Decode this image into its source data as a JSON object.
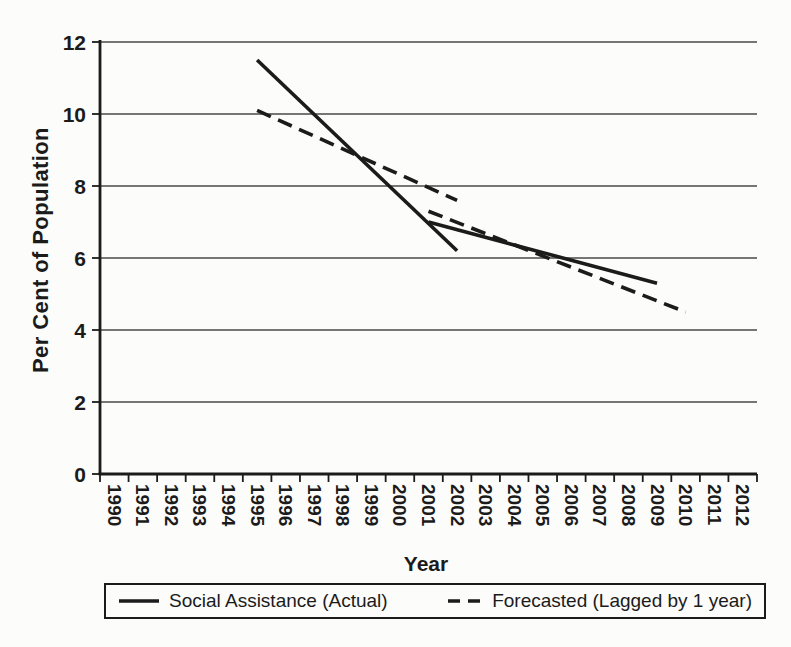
{
  "figure": {
    "background": "#fcfcfa",
    "line_color": "#1b1b1b"
  },
  "chart_data": {
    "type": "line",
    "title": "",
    "xlabel": "Year",
    "ylabel": "Per Cent of Population",
    "x_categories": [
      "1990",
      "1991",
      "1992",
      "1993",
      "1994",
      "1995",
      "1996",
      "1997",
      "1998",
      "1999",
      "2000",
      "2001",
      "2002",
      "2003",
      "2004",
      "2005",
      "2006",
      "2007",
      "2008",
      "2009",
      "2010",
      "2011",
      "2012"
    ],
    "y_ticks": [
      0,
      2,
      4,
      6,
      8,
      10,
      12
    ],
    "ylim": [
      0,
      12
    ],
    "grid": "horizontal",
    "legend_position": "bottom",
    "series": [
      {
        "name": "Social Assistance (Actual)",
        "style": "solid",
        "color": "#1b1b1b",
        "segments": [
          {
            "points": [
              [
                1995,
                11.5
              ],
              [
                2002,
                6.2
              ]
            ]
          },
          {
            "points": [
              [
                2001,
                7.0
              ],
              [
                2009,
                5.3
              ]
            ]
          }
        ]
      },
      {
        "name": "Forecasted (Lagged by 1 year)",
        "style": "dashed",
        "color": "#1b1b1b",
        "segments": [
          {
            "points": [
              [
                1995,
                10.1
              ],
              [
                2002,
                7.6
              ]
            ]
          },
          {
            "points": [
              [
                2001,
                7.3
              ],
              [
                2010,
                4.5
              ]
            ]
          }
        ]
      }
    ]
  }
}
